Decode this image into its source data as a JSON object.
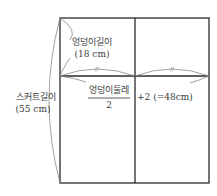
{
  "diagram": {
    "type": "skirt pattern draft",
    "hip_length": {
      "label": "엉덩이길이",
      "value": "(18 cm)"
    },
    "hip_circumference": {
      "numerator": "엉덩이둘레",
      "denominator": "2",
      "suffix": "+2 (=48cm)"
    },
    "skirt_length": {
      "label": "스커트길이",
      "value": "(55 cm)"
    },
    "equal_marks": "//",
    "colors": {
      "line": "#2a2a2a",
      "curve": "#777777"
    }
  }
}
